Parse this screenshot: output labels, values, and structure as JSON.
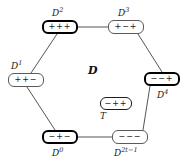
{
  "figure": {
    "center_label": "D",
    "background_color": "#ffffff",
    "line_color": "#555555"
  },
  "nodes": [
    {
      "id": "D2",
      "sign": "+++",
      "label": "D",
      "superscript": "2",
      "border": "bold",
      "x": 42,
      "y": 20,
      "w": 36,
      "h": 14,
      "label_x": 52,
      "label_y": 6
    },
    {
      "id": "D3",
      "sign": "+−+",
      "label": "D",
      "superscript": "3",
      "border": "thin",
      "x": 108,
      "y": 20,
      "w": 36,
      "h": 14,
      "label_x": 118,
      "label_y": 6
    },
    {
      "id": "D1",
      "sign": "++−",
      "label": "D",
      "superscript": "1",
      "border": "thin",
      "x": 8,
      "y": 73,
      "w": 36,
      "h": 14,
      "label_x": 11,
      "label_y": 59
    },
    {
      "id": "D4",
      "sign": "−−+",
      "label": "D",
      "superscript": "4",
      "border": "bold",
      "x": 144,
      "y": 72,
      "w": 36,
      "h": 14,
      "label_x": 157,
      "label_y": 88
    },
    {
      "id": "D0",
      "sign": "−+−",
      "label": "D",
      "superscript": "0",
      "border": "bold",
      "x": 42,
      "y": 130,
      "w": 36,
      "h": 14,
      "label_x": 52,
      "label_y": 146
    },
    {
      "id": "D2t-1",
      "sign": "−−−",
      "label": "D",
      "superscript": "2t−1",
      "border": "thin",
      "x": 112,
      "y": 130,
      "w": 36,
      "h": 14,
      "label_x": 114,
      "label_y": 146
    },
    {
      "id": "T",
      "sign": "−++",
      "label": "T",
      "superscript": "",
      "border": "medium",
      "x": 100,
      "y": 97,
      "w": 32,
      "h": 13,
      "label_x": 100,
      "label_y": 111
    }
  ],
  "edges": [
    {
      "from": "D2",
      "to": "D3",
      "x1": 78,
      "y1": 27,
      "x2": 108,
      "y2": 27
    },
    {
      "from": "D3",
      "to": "D4",
      "x1": 138,
      "y1": 34,
      "x2": 162,
      "y2": 72
    },
    {
      "from": "D4",
      "to": "D2t-1",
      "x1": 150,
      "y1": 86,
      "x2": 143,
      "y2": 130
    },
    {
      "from": "D2t-1",
      "to": "D0",
      "x1": 112,
      "y1": 137,
      "x2": 78,
      "y2": 137
    },
    {
      "from": "D0",
      "to": "D1",
      "x1": 55,
      "y1": 130,
      "x2": 27,
      "y2": 87
    },
    {
      "from": "D1",
      "to": "D2",
      "x1": 31,
      "y1": 73,
      "x2": 57,
      "y2": 34
    }
  ]
}
